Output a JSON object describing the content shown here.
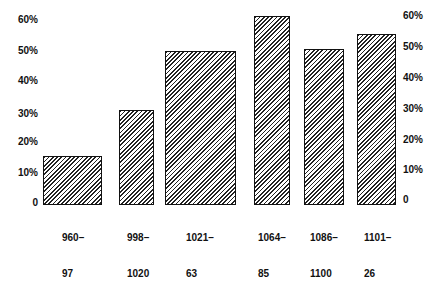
{
  "chart_data": {
    "type": "bar",
    "title": "",
    "xlabel": "",
    "ylabel": "",
    "categories": [
      "960–97",
      "998–1020",
      "1021–63",
      "1064–85",
      "1086–1100",
      "1101–26"
    ],
    "category_lines": [
      [
        "960–",
        "97"
      ],
      [
        "998–",
        "1020"
      ],
      [
        "1021–",
        "63"
      ],
      [
        "1064–",
        "85"
      ],
      [
        "1086–",
        "1100"
      ],
      [
        "1101–",
        "26"
      ]
    ],
    "values": [
      16,
      31,
      50.5,
      62,
      51,
      56
    ],
    "unit": "%",
    "ylim": [
      0,
      60
    ],
    "yticks": [
      "0",
      "10%",
      "20%",
      "30%",
      "40%",
      "50%",
      "60%"
    ],
    "y_axis_left": true,
    "y_axis_right": true,
    "grid": false,
    "legend": null,
    "bar_fill": "diagonal hatch",
    "colors": {
      "bar_stroke": "#111111",
      "hatch": "#222222",
      "background": "#ffffff"
    }
  }
}
